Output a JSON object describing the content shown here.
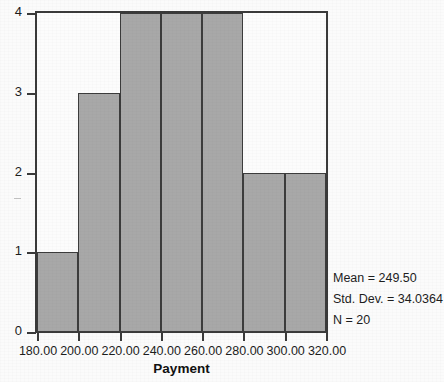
{
  "chart_data": {
    "type": "bar",
    "title": "",
    "subtitle": "",
    "xlabel": "Payment",
    "ylabel": "",
    "categories": [
      "180.00-200.00",
      "200.00-220.00",
      "220.00-240.00",
      "240.00-260.00",
      "260.00-280.00",
      "280.00-300.00",
      "300.00-320.00"
    ],
    "values": [
      1,
      3,
      4,
      4,
      4,
      2,
      2
    ],
    "bin_edges": [
      180,
      200,
      220,
      240,
      260,
      280,
      300,
      320
    ],
    "bin_width": 20,
    "xlim": [
      180,
      320
    ],
    "ylim": [
      0,
      4
    ],
    "x_tick_labels": [
      "180.00",
      "200.00",
      "220.00",
      "240.00",
      "260.00",
      "280.00",
      "300.00",
      "320.00"
    ],
    "x_tick_values": [
      180,
      200,
      220,
      240,
      260,
      280,
      300,
      320
    ],
    "y_tick_labels": [
      "0",
      "1",
      "2",
      "3",
      "4"
    ],
    "y_tick_values": [
      0,
      1,
      2,
      3,
      4
    ],
    "grid": false,
    "legend": false,
    "bar_fill_color": "#a8a8a8",
    "bar_edge_color": "#3c3c3c",
    "frame_color": "#3a3a3a",
    "background_color": "#fbfbfb",
    "annotations": [
      "Mean = 249.50",
      "Std. Dev. = 34.0364",
      "N = 20"
    ]
  },
  "statistics": {
    "mean_line": "Mean = 249.50",
    "stddev_line": "Std. Dev. = 34.0364",
    "n_line": "N = 20"
  }
}
